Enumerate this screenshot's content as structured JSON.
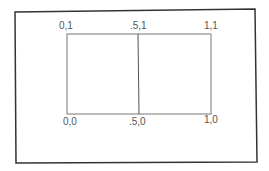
{
  "diagram": {
    "type": "unit-square-viewport",
    "labels": {
      "top_left": "0,1",
      "top_mid": ".5,1",
      "top_right": "1,1",
      "bottom_left": "0,0",
      "bottom_mid": ".5,0",
      "bottom_right": "1,0"
    },
    "colors": {
      "outer_border": "#333333",
      "inner_lines": "#777777",
      "text": "#555555"
    }
  }
}
